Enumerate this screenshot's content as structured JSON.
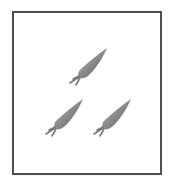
{
  "picture": {
    "subject": "carrots",
    "count": 3,
    "colors": {
      "border": "#505050",
      "body_dark": "#6e6e6e",
      "body_light": "#b8b8b8",
      "stem": "#7a7a7a"
    },
    "items": [
      {
        "name": "carrot-1",
        "x": 65,
        "y": 46
      },
      {
        "name": "carrot-2",
        "x": 41,
        "y": 97
      },
      {
        "name": "carrot-3",
        "x": 89,
        "y": 97
      }
    ]
  }
}
